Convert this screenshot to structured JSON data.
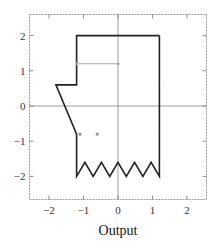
{
  "chart_data": {
    "type": "line",
    "title": "",
    "xlabel": "Output",
    "ylabel": "",
    "xlim": [
      -2.6,
      2.6
    ],
    "ylim": [
      -2.6,
      2.6
    ],
    "grid": false,
    "axes_lines_at_zero": true,
    "x_ticks": [
      -2,
      -1,
      0,
      1,
      2
    ],
    "y_ticks": [
      -2,
      -1,
      0,
      1,
      2
    ],
    "x_tick_labels": [
      "−2",
      "−1",
      "0",
      "1",
      "2"
    ],
    "y_tick_labels": [
      "−2",
      "−1",
      "0",
      "1",
      "2"
    ],
    "series": [
      {
        "name": "outline",
        "color": "#222222",
        "width": 1.6,
        "points": [
          [
            1.2,
            2.0
          ],
          [
            -1.2,
            2.0
          ],
          [
            -1.2,
            0.6
          ],
          [
            -1.8,
            0.6
          ],
          [
            -1.2,
            -0.8
          ],
          [
            -1.2,
            -2.0
          ],
          [
            -0.96,
            -1.6
          ],
          [
            -0.72,
            -2.0
          ],
          [
            -0.48,
            -1.6
          ],
          [
            -0.24,
            -2.0
          ],
          [
            0.0,
            -1.6
          ],
          [
            0.24,
            -2.0
          ],
          [
            0.48,
            -1.6
          ],
          [
            0.72,
            -2.0
          ],
          [
            0.96,
            -1.6
          ],
          [
            1.2,
            -2.0
          ],
          [
            1.2,
            2.0
          ]
        ]
      },
      {
        "name": "mouth-line",
        "color": "#aaaaaa",
        "width": 1.0,
        "points": [
          [
            -1.2,
            1.2
          ],
          [
            0.0,
            1.2
          ]
        ],
        "markers": true
      },
      {
        "name": "eyes",
        "color": "#999999",
        "type": "scatter",
        "points": [
          [
            -1.1,
            -0.8
          ],
          [
            -0.6,
            -0.8
          ]
        ]
      }
    ]
  },
  "labels": {
    "xlabel": "Output"
  }
}
